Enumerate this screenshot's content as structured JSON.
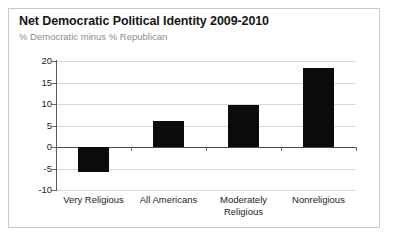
{
  "chart_data": {
    "type": "bar",
    "title": "Net Democratic Political Identity 2009-2010",
    "subtitle": "% Democratic minus % Republican",
    "xlabel": "",
    "ylabel": "",
    "categories": [
      "Very Religious",
      "All Americans",
      "Moderately Religious",
      "Nonreligious"
    ],
    "category_lines": [
      [
        "Very Religious"
      ],
      [
        "All Americans"
      ],
      [
        "Moderately",
        "Religious"
      ],
      [
        "Nonreligious"
      ]
    ],
    "values": [
      -5.7,
      6.0,
      9.8,
      18.3
    ],
    "ylim": [
      -10,
      20
    ],
    "yticks": [
      20,
      15,
      10,
      5,
      0,
      -5,
      -10
    ],
    "ytick_labels": [
      "20",
      "15",
      "10",
      "5",
      "0",
      "-5",
      "-10"
    ],
    "grid": true,
    "legend": "none",
    "bar_color": "#0b0b0b",
    "gridline_color": "#d9d9d9",
    "zero_line_color": "#4a4a4a",
    "axis_color": "#5a5a5a",
    "title_color": "#161616",
    "subtitle_color": "#8c8c8c",
    "background_color": "#ffffff",
    "border_color": "#c8c8c8"
  }
}
